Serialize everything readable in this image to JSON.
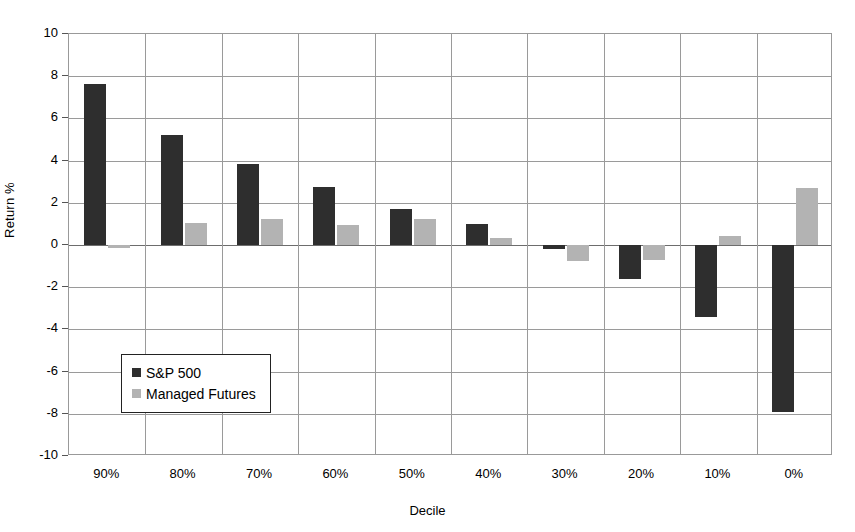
{
  "chart_data": {
    "type": "bar",
    "title": "",
    "xlabel": "Decile",
    "ylabel": "Return %",
    "categories": [
      "90%",
      "80%",
      "70%",
      "60%",
      "50%",
      "40%",
      "30%",
      "20%",
      "10%",
      "0%"
    ],
    "series": [
      {
        "name": "S&P 500",
        "color": "#2e2e2e",
        "values": [
          7.65,
          5.2,
          3.85,
          2.75,
          1.7,
          1.0,
          -0.2,
          -1.6,
          -3.4,
          -7.9
        ]
      },
      {
        "name": "Managed Futures",
        "color": "#b3b3b3",
        "values": [
          -0.15,
          1.05,
          1.25,
          0.95,
          1.25,
          0.35,
          -0.75,
          -0.7,
          0.45,
          2.7
        ]
      }
    ],
    "ylim": [
      -10,
      10
    ],
    "ytick_values": [
      10,
      8,
      6,
      4,
      2,
      0,
      -2,
      -4,
      -6,
      -8,
      -10
    ],
    "ytick_labels": [
      "10",
      "8",
      "6",
      "4",
      "2",
      "0",
      "-2",
      "-4",
      "-6",
      "-8",
      "-10"
    ],
    "grid": {
      "horizontal": true,
      "vertical": true,
      "color": "#9a9a9a"
    },
    "legend": {
      "position": "inside-lower-left",
      "entries": [
        "S&P 500",
        "Managed Futures"
      ]
    },
    "plot_border_color": "#999999",
    "background": "#ffffff"
  }
}
